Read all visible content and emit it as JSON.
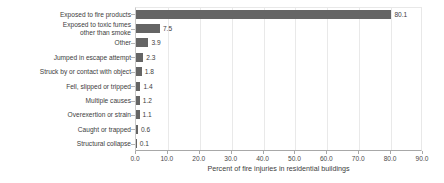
{
  "chart_data": {
    "type": "bar",
    "orientation": "horizontal",
    "title": "",
    "xlabel": "Percent of fire injuries in residential buildings",
    "ylabel": "",
    "xlim": [
      0.0,
      90.0
    ],
    "xticks": [
      "0.0",
      "10.0",
      "20.0",
      "30.0",
      "40.0",
      "50.0",
      "60.0",
      "70.0",
      "80.0",
      "90.0"
    ],
    "xtick_values": [
      0,
      10,
      20,
      30,
      40,
      50,
      60,
      70,
      80,
      90
    ],
    "grid": "vertical",
    "legend": "none",
    "bar_color": "#656565",
    "categories": [
      "Exposed to fire products",
      "Exposed to toxic fumes\nother than smoke",
      "Other",
      "Jumped in escape attempt",
      "Struck by or contact with object",
      "Fell, slipped or tripped",
      "Multiple causes",
      "Overexertion or strain",
      "Caught or trapped",
      "Structural collapse"
    ],
    "values": [
      80.1,
      7.5,
      3.9,
      2.3,
      1.8,
      1.4,
      1.2,
      1.1,
      0.6,
      0.1
    ],
    "value_labels": [
      "80.1",
      "7.5",
      "3.9",
      "2.3",
      "1.8",
      "1.4",
      "1.2",
      "1.1",
      "0.6",
      "0.1"
    ]
  }
}
